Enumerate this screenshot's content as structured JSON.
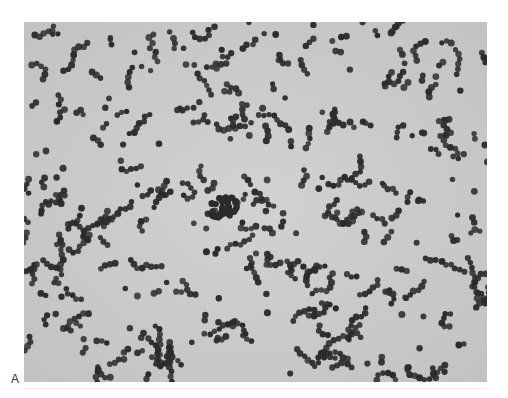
{
  "figure": {
    "panel_label": "A",
    "background_color": "#c9c9c9",
    "cell_color": "#2b2b2b"
  }
}
